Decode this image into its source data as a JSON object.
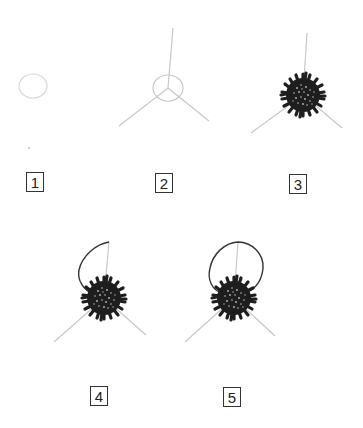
{
  "diagram": {
    "title": "",
    "colors": {
      "guide_line": "#c8c8c8",
      "outline": "#333333",
      "flower_head": "#1e1e1e",
      "speckle": "#bdbdbd",
      "box_border": "#333333"
    },
    "steps": [
      {
        "label": "1",
        "description": "faint oval"
      },
      {
        "label": "2",
        "description": "oval with three radiating guide lines"
      },
      {
        "label": "3",
        "description": "dense spiky dark flower head"
      },
      {
        "label": "4",
        "description": "flower head with half loop outline"
      },
      {
        "label": "5",
        "description": "flower head with complete loop outline"
      }
    ]
  }
}
